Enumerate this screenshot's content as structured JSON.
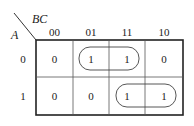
{
  "kmap": {
    "col_var": "BC",
    "row_var": "A",
    "col_headers": [
      "00",
      "01",
      "11",
      "10"
    ],
    "row_headers": [
      "0",
      "1"
    ],
    "cells": [
      [
        "0",
        "1",
        "1",
        "0"
      ],
      [
        "0",
        "0",
        "1",
        "1"
      ]
    ],
    "groups": [
      {
        "row": 0,
        "cols": [
          1,
          2
        ]
      },
      {
        "row": 1,
        "cols": [
          2,
          3
        ]
      }
    ]
  }
}
